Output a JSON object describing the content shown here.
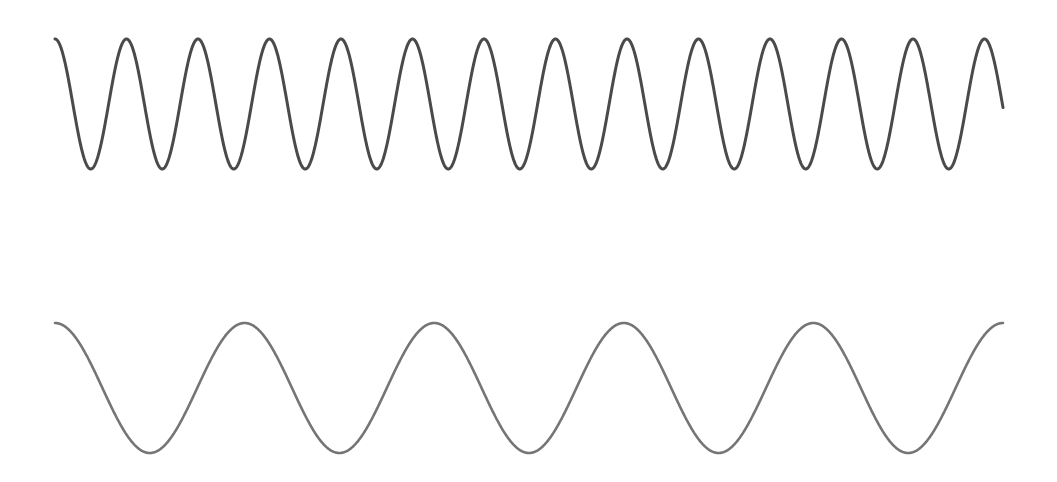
{
  "figure": {
    "background_color": "#ffffff",
    "width": 1057,
    "height": 482
  },
  "chart_data": {
    "type": "line",
    "title": "",
    "subtitle": "",
    "xlabel": "",
    "ylabel": "",
    "xlim": [
      0,
      1057
    ],
    "ylim": [
      0,
      482
    ],
    "grid": false,
    "axes_visible": false,
    "ticks_visible": false,
    "legend": null,
    "legend_position": "none",
    "annotations": [],
    "series": [
      {
        "name": "high-frequency-wave",
        "waveform": "cosine",
        "color": "#4a4a4a",
        "stroke_width": 3.0,
        "x_start": 55,
        "x_end": 1003,
        "span_px": 948,
        "center_y": 104,
        "amplitude_px": 65,
        "peak_y": 39,
        "trough_y": 169,
        "period_px": 71.5,
        "cycles": 13.26,
        "phase": "starts at peak",
        "peak_x_positions": [
          55,
          126.5,
          198,
          269.5,
          341,
          412.5,
          484,
          555.5,
          627,
          698.5,
          770,
          841.5,
          913
        ],
        "trough_x_positions": [
          90.75,
          162.25,
          233.75,
          305.25,
          376.75,
          448.25,
          519.75,
          591.25,
          662.75,
          734.25,
          805.75,
          877.25,
          948.75
        ]
      },
      {
        "name": "low-frequency-wave",
        "waveform": "cosine",
        "color": "#757575",
        "stroke_width": 2.6,
        "x_start": 55,
        "x_end": 1003,
        "span_px": 948,
        "center_y": 388,
        "amplitude_px": 65,
        "peak_y": 323,
        "trough_y": 453,
        "period_px": 189.6,
        "cycles": 5.0,
        "phase": "starts at peak",
        "peak_x_positions": [
          55,
          244.6,
          434.2,
          623.8,
          813.4,
          1003
        ],
        "trough_x_positions": [
          149.8,
          339.4,
          529,
          718.6,
          908.2
        ]
      }
    ]
  }
}
